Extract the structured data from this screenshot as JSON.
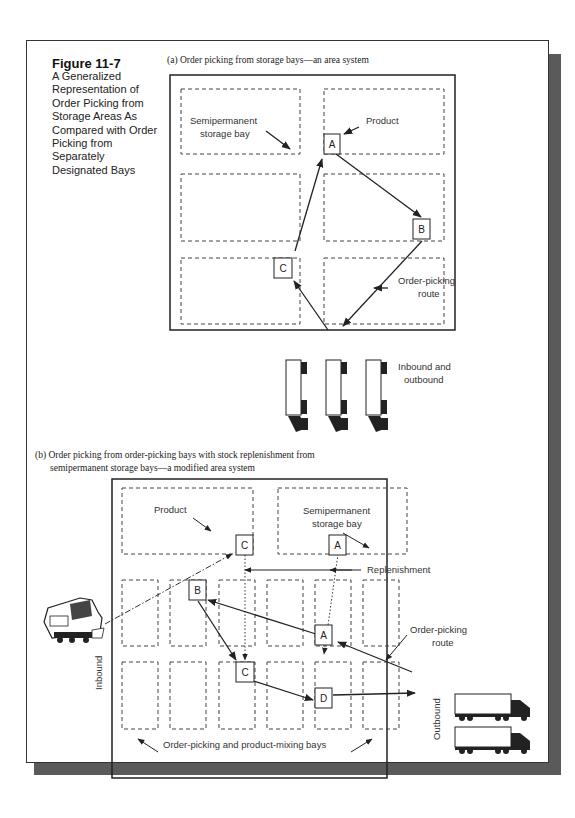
{
  "figure": {
    "number": "Figure 11-7",
    "caption": "A Generalized Representation of Order Picking from Storage Areas As Compared with Order Picking from Separately Designated Bays"
  },
  "panel_a": {
    "title": "(a) Order picking from storage bays—an area system",
    "labels": {
      "semipermanent_line1": "Semipermanent",
      "semipermanent_line2": "storage bay",
      "product": "Product",
      "route_line1": "Order-picking",
      "route_line2": "route",
      "trucks_line1": "Inbound and",
      "trucks_line2": "outbound"
    },
    "items": [
      "A",
      "B",
      "C"
    ]
  },
  "panel_b": {
    "title_line1": "(b) Order picking from order-picking bays with stock replenishment from",
    "title_line2": "semipermanent storage bays—a modified area system",
    "labels": {
      "product": "Product",
      "semipermanent_line1": "Semipermanent",
      "semipermanent_line2": "storage bay",
      "replenishment": "Replenishment",
      "route_line1": "Order-picking",
      "route_line2": "route",
      "inbound": "Inbound",
      "outbound": "Outbound",
      "bays": "Order-picking and product-mixing bays"
    },
    "items": [
      "C",
      "A",
      "B",
      "A",
      "C",
      "D"
    ]
  },
  "colors": {
    "line": "#222222",
    "shadow": "#5a5a5a",
    "dash": "#444444"
  }
}
